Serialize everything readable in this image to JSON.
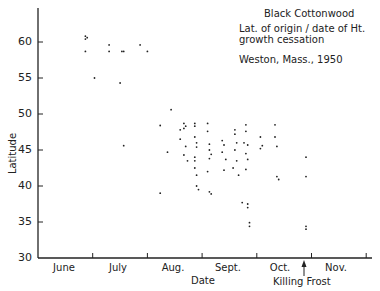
{
  "chart_data": {
    "type": "scatter",
    "title": "Black Cottonwood",
    "subtitle": [
      "Lat. of origin / date of Ht.",
      "growth cessation",
      "Weston, Mass., 1950"
    ],
    "xlabel": "Date",
    "ylabel": "Latitude",
    "x_unit": "days since June 1",
    "xlim": [
      0,
      180
    ],
    "ylim": [
      30,
      65
    ],
    "yticks": [
      30,
      35,
      40,
      45,
      50,
      55,
      60
    ],
    "xtick_labels": [
      "June",
      "July",
      "Aug.",
      "Sept.",
      "Oct.",
      "Nov."
    ],
    "grid": false,
    "legend": null,
    "annotations": [
      {
        "text": "Killing Frost",
        "x": 148,
        "arrow": true
      }
    ],
    "series": [
      {
        "name": "Clones",
        "points": [
          [
            26,
            60.8
          ],
          [
            26,
            60.4
          ],
          [
            27,
            60.6
          ],
          [
            26,
            58.7
          ],
          [
            31,
            55.0
          ],
          [
            39,
            59.6
          ],
          [
            39,
            58.7
          ],
          [
            45,
            54.3
          ],
          [
            46,
            58.7
          ],
          [
            47,
            58.7
          ],
          [
            47,
            45.6
          ],
          [
            56,
            59.6
          ],
          [
            60,
            58.7
          ],
          [
            67,
            48.4
          ],
          [
            67,
            39.0
          ],
          [
            71,
            44.7
          ],
          [
            73,
            50.6
          ],
          [
            78,
            47.8
          ],
          [
            78,
            46.5
          ],
          [
            80,
            48.7
          ],
          [
            81,
            48.3
          ],
          [
            80,
            48.0
          ],
          [
            81,
            45.5
          ],
          [
            80,
            44.3
          ],
          [
            82,
            43.5
          ],
          [
            86,
            48.7
          ],
          [
            86,
            48.3
          ],
          [
            86,
            46.8
          ],
          [
            87,
            46.0
          ],
          [
            87,
            45.4
          ],
          [
            86,
            44.0
          ],
          [
            86,
            42.5
          ],
          [
            88,
            39.5
          ],
          [
            87,
            40.0
          ],
          [
            86,
            43.5
          ],
          [
            87,
            41.5
          ],
          [
            93,
            48.7
          ],
          [
            93,
            47.6
          ],
          [
            94,
            45.8
          ],
          [
            94,
            45.0
          ],
          [
            95,
            44.4
          ],
          [
            94,
            43.8
          ],
          [
            93,
            42.0
          ],
          [
            94,
            39.2
          ],
          [
            95,
            38.9
          ],
          [
            101,
            46.3
          ],
          [
            102,
            45.7
          ],
          [
            101,
            44.7
          ],
          [
            103,
            43.7
          ],
          [
            102,
            42.2
          ],
          [
            108,
            47.8
          ],
          [
            108,
            47.2
          ],
          [
            109,
            46.0
          ],
          [
            108,
            45.0
          ],
          [
            109,
            43.5
          ],
          [
            107,
            42.5
          ],
          [
            110,
            41.5
          ],
          [
            114,
            48.5
          ],
          [
            114,
            47.6
          ],
          [
            113,
            46.0
          ],
          [
            115,
            45.7
          ],
          [
            114,
            44.5
          ],
          [
            115,
            43.7
          ],
          [
            114,
            42.3
          ],
          [
            112,
            37.7
          ],
          [
            115,
            37.5
          ],
          [
            115,
            37.0
          ],
          [
            116,
            34.9
          ],
          [
            116,
            34.4
          ],
          [
            122,
            46.8
          ],
          [
            123,
            45.6
          ],
          [
            122,
            45.2
          ],
          [
            130,
            48.5
          ],
          [
            130,
            46.8
          ],
          [
            131,
            45.5
          ],
          [
            131,
            41.3
          ],
          [
            132,
            40.9
          ],
          [
            147,
            44.0
          ],
          [
            147,
            41.3
          ],
          [
            147,
            34.4
          ],
          [
            147,
            34.0
          ]
        ]
      }
    ]
  }
}
